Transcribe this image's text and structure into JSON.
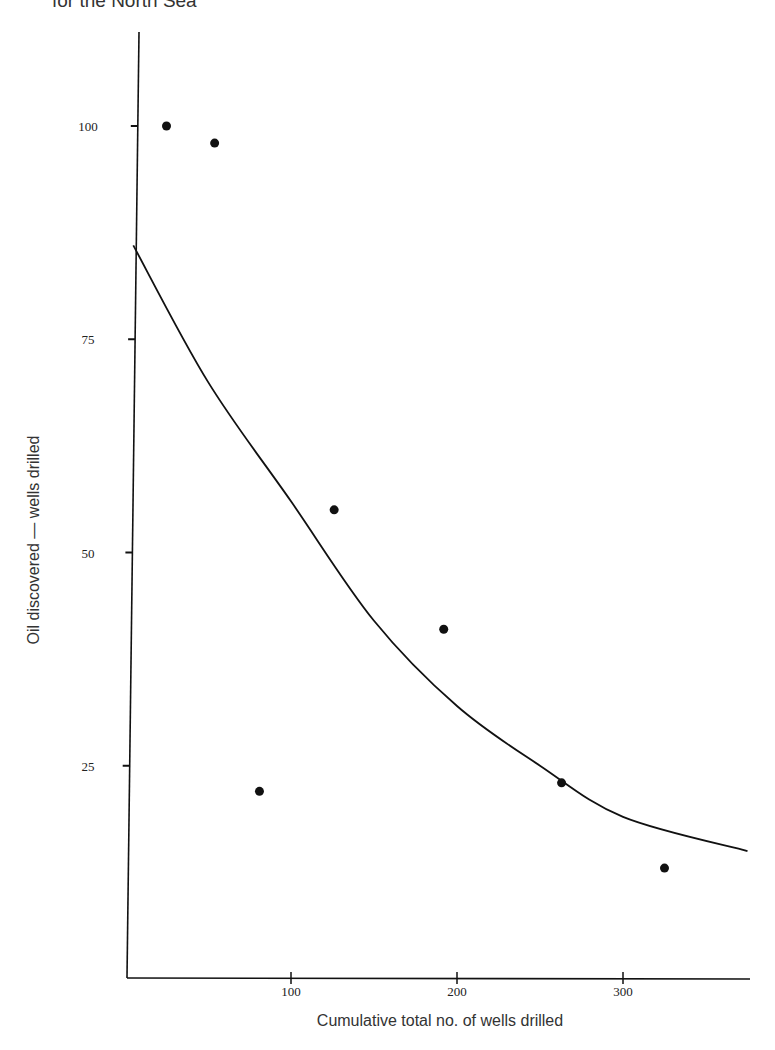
{
  "title": "for the North Sea",
  "chart_data": {
    "type": "scatter",
    "title": "for the North Sea",
    "xlabel": "Cumulative total no. of wells drilled",
    "ylabel": "Oil discovered — wells drilled",
    "x_ticks": [
      "100",
      "200",
      "300"
    ],
    "y_ticks": [
      "25",
      "50",
      "75",
      "100"
    ],
    "xlim": [
      0,
      375
    ],
    "ylim": [
      0,
      110
    ],
    "grid": false,
    "legend": null,
    "series": [
      {
        "name": "observed",
        "kind": "points",
        "points": [
          {
            "x": 25,
            "y": 100
          },
          {
            "x": 54,
            "y": 98
          },
          {
            "x": 81,
            "y": 22
          },
          {
            "x": 126,
            "y": 55
          },
          {
            "x": 192,
            "y": 41
          },
          {
            "x": 263,
            "y": 23
          },
          {
            "x": 325,
            "y": 13
          }
        ]
      },
      {
        "name": "fitted curve",
        "kind": "line",
        "points": [
          {
            "x": 5,
            "y": 86
          },
          {
            "x": 50,
            "y": 70
          },
          {
            "x": 100,
            "y": 56
          },
          {
            "x": 150,
            "y": 42
          },
          {
            "x": 200,
            "y": 32
          },
          {
            "x": 250,
            "y": 25
          },
          {
            "x": 300,
            "y": 19
          },
          {
            "x": 375,
            "y": 15
          }
        ]
      }
    ]
  }
}
